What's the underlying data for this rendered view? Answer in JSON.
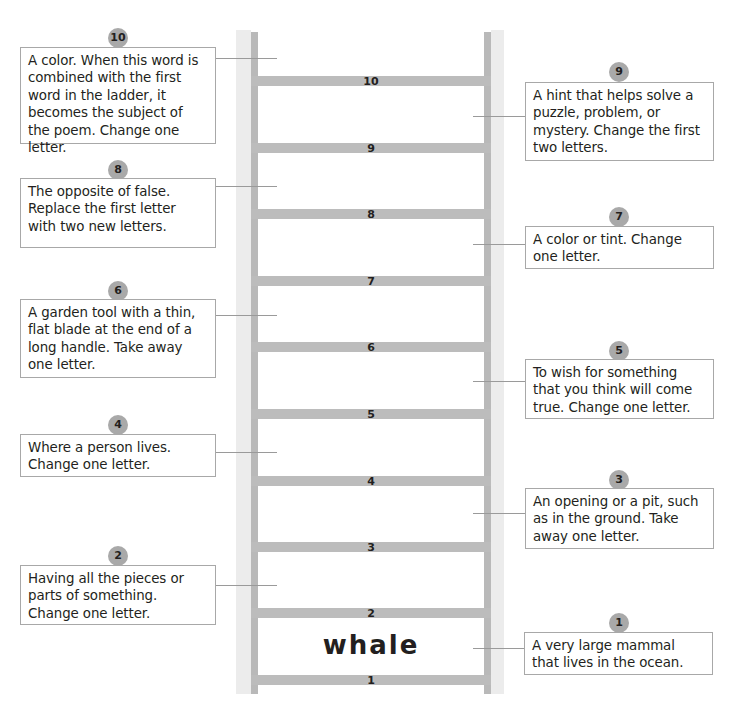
{
  "ladder": {
    "rungs": [
      {
        "number": "10",
        "top": 76
      },
      {
        "number": "9",
        "top": 143
      },
      {
        "number": "8",
        "top": 209
      },
      {
        "number": "7",
        "top": 276
      },
      {
        "number": "6",
        "top": 342
      },
      {
        "number": "5",
        "top": 409
      },
      {
        "number": "4",
        "top": 476
      },
      {
        "number": "3",
        "top": 542
      },
      {
        "number": "2",
        "top": 608
      },
      {
        "number": "1",
        "top": 675
      }
    ],
    "start_word": "whale",
    "colors": {
      "rail_light": "#ececec",
      "rail_dark": "#b9b9b9",
      "rung": "#bcbcbc",
      "badge": "#a9a9a9"
    }
  },
  "clues": {
    "c10": {
      "number": "10",
      "text": "A color.  When this word is combined with the first word in the ladder, it becomes the subject of the poem.  Change one letter."
    },
    "c9": {
      "number": "9",
      "text": "A hint that helps solve a puzzle, problem, or mystery.  Change the first two letters."
    },
    "c8": {
      "number": "8",
      "text": "The opposite of false. Replace the first letter with two new letters."
    },
    "c7": {
      "number": "7",
      "text": "A color or tint.  Change one letter."
    },
    "c6": {
      "number": "6",
      "text": "A garden tool with a thin, flat blade at the end of a long handle.  Take away one letter."
    },
    "c5": {
      "number": "5",
      "text": "To wish for something that you think will come true. Change one letter."
    },
    "c4": {
      "number": "4",
      "text": "Where a person lives. Change one letter."
    },
    "c3": {
      "number": "3",
      "text": "An opening or a pit, such as in the ground.  Take away one letter."
    },
    "c2": {
      "number": "2",
      "text": "Having all the pieces or parts of something. Change one letter."
    },
    "c1": {
      "number": "1",
      "text": "A very large mammal that lives in the ocean."
    }
  }
}
